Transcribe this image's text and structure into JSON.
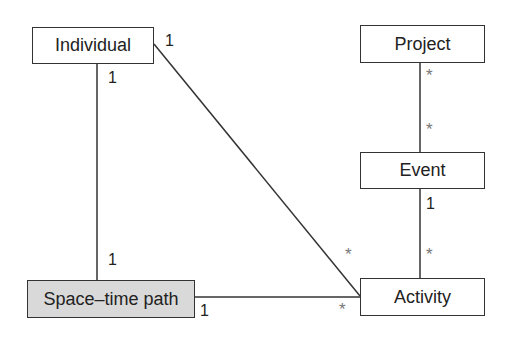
{
  "diagram": {
    "type": "uml-class-diagram",
    "entities": {
      "individual": {
        "label": "Individual"
      },
      "project": {
        "label": "Project"
      },
      "event": {
        "label": "Event"
      },
      "space_time_path": {
        "label": "Space–time path"
      },
      "activity": {
        "label": "Activity"
      }
    },
    "multiplicities": {
      "individual_to_activity_near_individual": "1",
      "individual_to_path_near_individual": "1",
      "individual_to_path_near_path": "1",
      "project_to_event_near_project": "*",
      "project_to_event_near_event": "*",
      "event_to_activity_near_event": "1",
      "event_to_activity_near_activity": "*",
      "individual_to_activity_near_activity": "*",
      "path_to_activity_near_path": "1",
      "path_to_activity_near_activity": "*"
    },
    "relations": [
      {
        "from": "Individual",
        "to": "Activity",
        "from_mult": "1",
        "to_mult": "*"
      },
      {
        "from": "Individual",
        "to": "Space–time path",
        "from_mult": "1",
        "to_mult": "1"
      },
      {
        "from": "Project",
        "to": "Event",
        "from_mult": "*",
        "to_mult": "*"
      },
      {
        "from": "Event",
        "to": "Activity",
        "from_mult": "1",
        "to_mult": "*"
      },
      {
        "from": "Space–time path",
        "to": "Activity",
        "from_mult": "1",
        "to_mult": "*"
      }
    ],
    "colors": {
      "line": "#333333",
      "shaded_fill": "#d9d9d9",
      "star": "#777777"
    }
  }
}
